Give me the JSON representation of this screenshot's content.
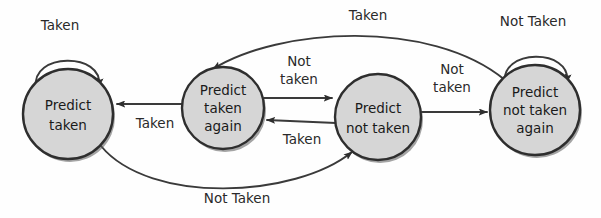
{
  "diagram": {
    "type": "finite-state-machine",
    "background_color": "#fefefe",
    "state_fill_color": "#d6d6d6",
    "state_stroke_color": "#2e2e2e",
    "edge_color": "#3a3a3a",
    "states": [
      {
        "id": "predict-taken",
        "lines": [
          "Predict",
          "taken"
        ],
        "line1": "Predict",
        "line2": "taken",
        "line3": "",
        "cx": 68,
        "cy": 114,
        "r": 45
      },
      {
        "id": "predict-taken-again",
        "lines": [
          "Predict",
          "taken",
          "again"
        ],
        "line1": "Predict",
        "line2": "taken",
        "line3": "again",
        "cx": 223,
        "cy": 108,
        "r": 41
      },
      {
        "id": "predict-not-taken",
        "lines": [
          "Predict",
          "not taken"
        ],
        "line1": "Predict",
        "line2": "not taken",
        "line3": "",
        "cx": 378,
        "cy": 117,
        "r": 43
      },
      {
        "id": "predict-not-taken-again",
        "lines": [
          "Predict",
          "not taken",
          "again"
        ],
        "line1": "Predict",
        "line2": "not taken",
        "line3": "again",
        "cx": 535,
        "cy": 110,
        "r": 45
      }
    ],
    "transitions": [
      {
        "id": "t-self-left",
        "from": "predict-taken",
        "to": "predict-taken",
        "label": "Taken",
        "label_lines": [
          "Taken"
        ],
        "kind": "self-loop-top"
      },
      {
        "id": "t-2-to-1",
        "from": "predict-taken-again",
        "to": "predict-taken",
        "label": "Taken",
        "label_lines": [
          "Taken"
        ],
        "kind": "straight-left"
      },
      {
        "id": "t-2-to-3",
        "from": "predict-taken-again",
        "to": "predict-not-taken",
        "label": "Not taken",
        "label_lines": [
          "Not",
          "taken"
        ],
        "kind": "straight-right"
      },
      {
        "id": "t-3-to-2",
        "from": "predict-not-taken",
        "to": "predict-taken-again",
        "label": "Taken",
        "label_lines": [
          "Taken"
        ],
        "kind": "straight-left"
      },
      {
        "id": "t-3-to-4",
        "from": "predict-not-taken",
        "to": "predict-not-taken-again",
        "label": "Not taken",
        "label_lines": [
          "Not",
          "taken"
        ],
        "kind": "straight-right"
      },
      {
        "id": "t-self-right",
        "from": "predict-not-taken-again",
        "to": "predict-not-taken-again",
        "label": "Not Taken",
        "label_lines": [
          "Not Taken"
        ],
        "kind": "self-loop-top"
      },
      {
        "id": "t-4-to-2",
        "from": "predict-not-taken-again",
        "to": "predict-taken-again",
        "label": "Taken",
        "label_lines": [
          "Taken"
        ],
        "kind": "arc-top"
      },
      {
        "id": "t-1-to-3",
        "from": "predict-taken",
        "to": "predict-not-taken",
        "label": "Not Taken",
        "label_lines": [
          "Not Taken"
        ],
        "kind": "arc-bottom"
      }
    ],
    "labels": {
      "self_left": "Taken",
      "self_right": "Not Taken",
      "arc_top": "Taken",
      "arc_bottom": "Not Taken",
      "mid_left_taken": "Taken",
      "mid_not_line1": "Not",
      "mid_not_line2": "taken",
      "mid_taken_below": "Taken",
      "right_not_line1": "Not",
      "right_not_line2": "taken"
    }
  }
}
